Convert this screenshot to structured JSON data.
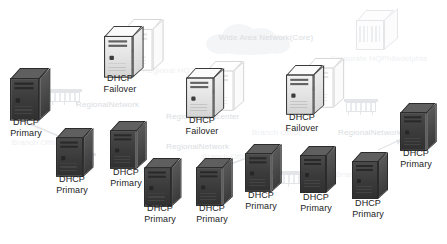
{
  "diagram": {
    "background_color": "#ffffff",
    "node_label_color": "#1d1d1d",
    "faded_label_color": "#c9cdd4",
    "labels": {
      "dhcp": "DHCP",
      "primary": "Primary",
      "failover": "Failover"
    },
    "nodes": [
      {
        "id": "n1",
        "type": "server-primary",
        "line1": "DHCP",
        "line2": "Primary",
        "x": 10,
        "y": 68,
        "label_x": 2,
        "label_y": 117,
        "scale": 1.12,
        "shade": "dark"
      },
      {
        "id": "n2",
        "type": "server-failover",
        "line1": "DHCP",
        "line2": "Failover",
        "x": 104,
        "y": 26,
        "label_x": 96,
        "label_y": 73,
        "scale": 1.1,
        "shade": "light"
      },
      {
        "id": "n3",
        "type": "server-failover",
        "line1": "DHCP",
        "line2": "Failover",
        "x": 186,
        "y": 68,
        "label_x": 178,
        "label_y": 115,
        "scale": 1.06,
        "shade": "light"
      },
      {
        "id": "n4",
        "type": "server-failover",
        "line1": "DHCP",
        "line2": "Failover",
        "x": 286,
        "y": 65,
        "label_x": 278,
        "label_y": 112,
        "scale": 1.06,
        "shade": "light"
      },
      {
        "id": "n5",
        "type": "server-primary",
        "line1": "DHCP",
        "line2": "Primary",
        "x": 400,
        "y": 103,
        "label_x": 392,
        "label_y": 148,
        "scale": 1.02,
        "shade": "dark"
      },
      {
        "id": "n6",
        "type": "server-primary",
        "line1": "DHCP",
        "line2": "Primary",
        "x": 56,
        "y": 128,
        "label_x": 48,
        "label_y": 174,
        "scale": 1.04,
        "shade": "dark"
      },
      {
        "id": "n7",
        "type": "server-primary",
        "line1": "DHCP",
        "line2": "Primary",
        "x": 110,
        "y": 121,
        "label_x": 102,
        "label_y": 167,
        "scale": 1.02,
        "shade": "dark"
      },
      {
        "id": "n8",
        "type": "server-primary",
        "line1": "DHCP",
        "line2": "Primary",
        "x": 144,
        "y": 158,
        "label_x": 136,
        "label_y": 203,
        "scale": 1.04,
        "shade": "dark"
      },
      {
        "id": "n9",
        "type": "server-primary",
        "line1": "DHCP",
        "line2": "Primary",
        "x": 196,
        "y": 158,
        "label_x": 188,
        "label_y": 203,
        "scale": 1.02,
        "shade": "dark"
      },
      {
        "id": "n10",
        "type": "server-primary",
        "line1": "DHCP",
        "line2": "Primary",
        "x": 245,
        "y": 144,
        "label_x": 237,
        "label_y": 190,
        "scale": 1.02,
        "shade": "dark"
      },
      {
        "id": "n11",
        "type": "server-primary",
        "line1": "DHCP",
        "line2": "Primary",
        "x": 300,
        "y": 146,
        "label_x": 292,
        "label_y": 192,
        "scale": 1.0,
        "shade": "dark"
      },
      {
        "id": "n12",
        "type": "server-primary",
        "line1": "DHCP",
        "line2": "Primary",
        "x": 352,
        "y": 152,
        "label_x": 344,
        "label_y": 198,
        "scale": 1.0,
        "shade": "dark"
      }
    ],
    "background_labels": [
      {
        "id": "b1",
        "line1": "Wide Area Network",
        "line2": "(Core)",
        "x": 218,
        "y": 33,
        "w": 96,
        "opacity": "faint"
      },
      {
        "id": "b2",
        "line1": "Corporate HQ",
        "line2": "Philadelphia",
        "x": 330,
        "y": 54,
        "w": 86,
        "opacity": "vfaint"
      },
      {
        "id": "b3",
        "line1": "Regional HQ",
        "line2": "Tokyo",
        "x": 140,
        "y": 66,
        "w": 74,
        "opacity": "vfaint"
      },
      {
        "id": "b4",
        "line1": "Regional",
        "line2": "Network",
        "x": 76,
        "y": 100,
        "w": 58,
        "opacity": "faint"
      },
      {
        "id": "b5",
        "line1": "Regional",
        "line2": "Datacenter",
        "x": 166,
        "y": 112,
        "w": 62,
        "opacity": "faint"
      },
      {
        "id": "b6",
        "line1": "Regional",
        "line2": "Network",
        "x": 166,
        "y": 142,
        "w": 58,
        "opacity": "faint"
      },
      {
        "id": "b7",
        "line1": "Regional",
        "line2": "Network",
        "x": 338,
        "y": 128,
        "w": 58,
        "opacity": "faint"
      },
      {
        "id": "b8",
        "line1": "Branch Office",
        "line2": "",
        "x": 6,
        "y": 138,
        "w": 62,
        "opacity": "vfaint"
      },
      {
        "id": "b9",
        "line1": "Branch Office",
        "line2": "",
        "x": 246,
        "y": 128,
        "w": 62,
        "opacity": "vfaint"
      },
      {
        "id": "b10",
        "line1": "Branch Office",
        "line2": "",
        "x": 330,
        "y": 170,
        "w": 62,
        "opacity": "vfaint"
      },
      {
        "id": "b11",
        "line1": "Branch Office",
        "line2": "",
        "x": 196,
        "y": 152,
        "w": 62,
        "opacity": "vfaint"
      }
    ],
    "faint_shapes": {
      "cloud": {
        "id": "cloud-core",
        "x": 206,
        "y": 22,
        "name": "wan-cloud"
      },
      "hq_cube": {
        "id": "hq-cube",
        "x": 356,
        "y": 10,
        "name": "corporate-hq-building"
      },
      "switches": [
        {
          "id": "sw1",
          "x": 48,
          "y": 86
        },
        {
          "id": "sw2",
          "x": 344,
          "y": 96
        },
        {
          "id": "sw3",
          "x": 272,
          "y": 168
        },
        {
          "id": "sw4",
          "x": 62,
          "y": 150
        }
      ]
    }
  }
}
